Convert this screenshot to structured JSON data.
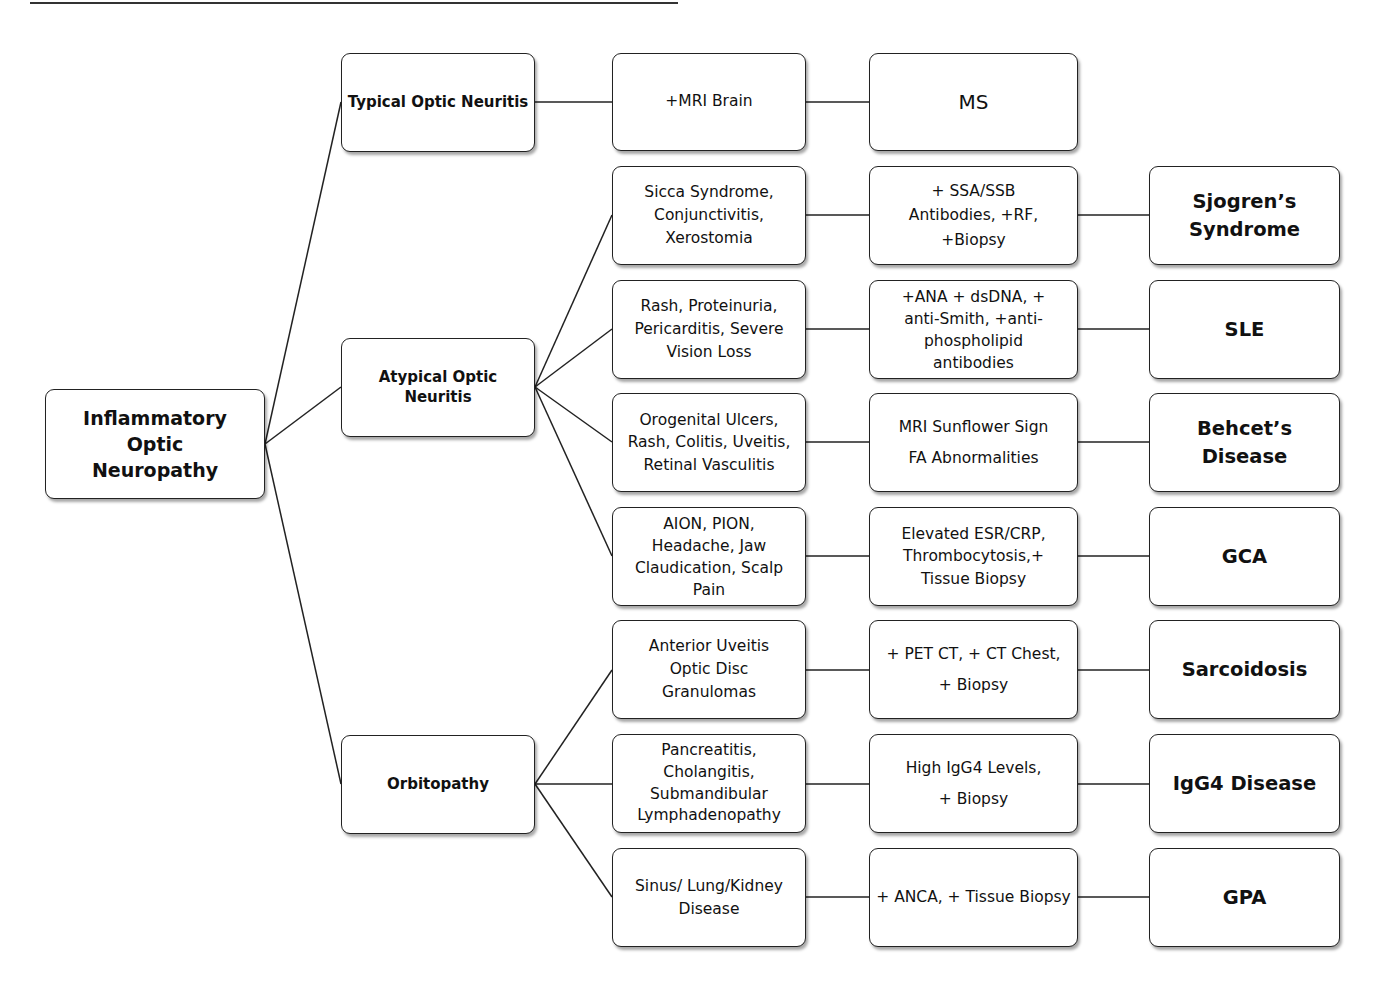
{
  "diagram": {
    "root": {
      "label": "Inflammatory Optic\nNeuropathy"
    },
    "categories": [
      {
        "label": "Typical Optic Neuritis"
      },
      {
        "label": "Atypical Optic\nNeuritis"
      },
      {
        "label": "Orbitopathy"
      }
    ],
    "rows": [
      {
        "category": "Typical Optic Neuritis",
        "findings": "",
        "test": "+MRI Brain",
        "diagnosis": "MS"
      },
      {
        "category": "Atypical Optic Neuritis",
        "findings": "Sicca Syndrome,\nConjunctivitis,\nXerostomia",
        "test": "+ SSA/SSB\nAntibodies, +RF,\n+Biopsy",
        "diagnosis": "Sjogren’s\nSyndrome"
      },
      {
        "category": "Atypical Optic Neuritis",
        "findings": "Rash, Proteinuria,\nPericarditis, Severe\nVision Loss",
        "test": "+ANA  + dsDNA, +\nanti-Smith, +anti-\nphospholipid\nantibodies",
        "diagnosis": "SLE"
      },
      {
        "category": "Atypical Optic Neuritis",
        "findings": "Orogenital Ulcers,\nRash, Colitis, Uveitis,\nRetinal Vasculitis",
        "test": "MRI Sunflower Sign\nFA Abnormalities",
        "diagnosis": "Behcet’s Disease"
      },
      {
        "category": "Atypical Optic Neuritis",
        "findings": "AION, PION,\nHeadache, Jaw\nClaudication, Scalp\nPain",
        "test": "Elevated ESR/CRP,\nThrombocytosis,+\nTissue Biopsy",
        "diagnosis": "GCA"
      },
      {
        "category": "Orbitopathy",
        "findings": "Anterior Uveitis\nOptic Disc\nGranulomas",
        "test": "+ PET CT, + CT Chest,\n+ Biopsy",
        "diagnosis": "Sarcoidosis"
      },
      {
        "category": "Orbitopathy",
        "findings": "Pancreatitis,\nCholangitis,\nSubmandibular\nLymphadenopathy",
        "test": "High IgG4 Levels,\n+ Biopsy",
        "diagnosis": "IgG4 Disease"
      },
      {
        "category": "Orbitopathy",
        "findings": "Sinus/ Lung/Kidney\nDisease",
        "test": "+ ANCA, + Tissue Biopsy",
        "diagnosis": "GPA"
      }
    ],
    "colors": {
      "line": "#222222",
      "box_border": "#222222",
      "background": "#ffffff"
    }
  }
}
